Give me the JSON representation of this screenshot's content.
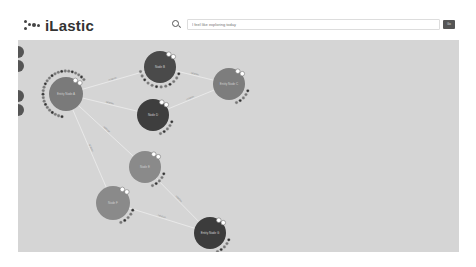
{
  "app": {
    "title": "iLastic"
  },
  "search": {
    "placeholder": "I feel like exploring today",
    "value": "",
    "button_label": "Go"
  },
  "sidebar": {
    "buttons": [
      {
        "name": "tool-1"
      },
      {
        "name": "tool-2"
      },
      {
        "name": "tool-3"
      },
      {
        "name": "tool-4"
      }
    ]
  },
  "graph": {
    "nodes": [
      {
        "id": "n1",
        "label": "Entity Node A",
        "x": 48,
        "y": 54,
        "r": 17,
        "color": "#7a7a7a"
      },
      {
        "id": "n2",
        "label": "Node B",
        "x": 142,
        "y": 27,
        "r": 16,
        "color": "#4a4a4a"
      },
      {
        "id": "n3",
        "label": "Entity Node C",
        "x": 211,
        "y": 44,
        "r": 16,
        "color": "#7d7d7d"
      },
      {
        "id": "n4",
        "label": "Node D",
        "x": 135,
        "y": 75,
        "r": 16,
        "color": "#3e3e3e"
      },
      {
        "id": "n5",
        "label": "Node E",
        "x": 127,
        "y": 127,
        "r": 16,
        "color": "#8a8a8a"
      },
      {
        "id": "n6",
        "label": "Node F",
        "x": 95,
        "y": 163,
        "r": 17,
        "color": "#8a8a8a"
      },
      {
        "id": "n7",
        "label": "Entity Node G",
        "x": 192,
        "y": 193,
        "r": 16,
        "color": "#3c3c3c"
      }
    ],
    "edges": [
      {
        "from": "n1",
        "to": "n2",
        "label": "relation"
      },
      {
        "from": "n1",
        "to": "n4",
        "label": "relation"
      },
      {
        "from": "n2",
        "to": "n3",
        "label": "relation"
      },
      {
        "from": "n4",
        "to": "n3",
        "label": "relation"
      },
      {
        "from": "n1",
        "to": "n5",
        "label": "relation"
      },
      {
        "from": "n1",
        "to": "n6",
        "label": "relation"
      },
      {
        "from": "n5",
        "to": "n7",
        "label": "relation"
      },
      {
        "from": "n6",
        "to": "n7",
        "label": "relation"
      }
    ]
  },
  "colors": {
    "canvas_bg": "#d5d5d5",
    "edge": "#eeeeee",
    "dot": "#666666"
  }
}
